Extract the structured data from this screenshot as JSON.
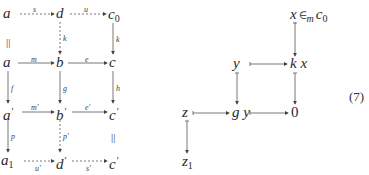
{
  "equation_number": "(7)",
  "left_diagram": {
    "nodes": {
      "r1c1": "a",
      "r1c2": "d",
      "r1c3": "c",
      "r1c3_sub": "0",
      "r2c1": "a",
      "r2c2": "b",
      "r2c3": "c",
      "r3c1": "a",
      "r3c2": "b",
      "r3c3": "c",
      "r4c1": "a",
      "r4c1_sub": "1",
      "r4c2": "d",
      "r4c3": "c"
    },
    "prime_mark": "′",
    "edges": {
      "r1_h1": "s",
      "r1_h2": "u",
      "r2_h1": "m",
      "r2_h2": "e",
      "r3_h1": "m′",
      "r3_h2": "e′",
      "r4_h1": "u′",
      "r4_h2": "s′",
      "v_r1c1": "||",
      "v_r1c2": "k",
      "v_r1c3": "k",
      "v_r2c1": "f",
      "v_r2c2": "g",
      "v_r2c3": "h",
      "v_r3c1": "p",
      "v_r3c2": "p′",
      "v_r3c3": "||"
    }
  },
  "right_diagram": {
    "nodes": {
      "top": "x",
      "top_rel": "∈",
      "top_rel_sub": "m",
      "top_target": "c",
      "top_target_sub": "0",
      "mid_left": "y",
      "mid_right": "k x",
      "bot_left": "z",
      "bot_mid": "g y",
      "bot_right": "0",
      "bottom": "z",
      "bottom_sub": "1"
    }
  }
}
